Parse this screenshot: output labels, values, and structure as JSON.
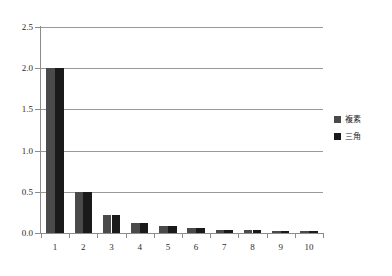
{
  "chart_data": {
    "type": "bar",
    "title": "",
    "xlabel": "",
    "ylabel": "",
    "categories": [
      "1",
      "2",
      "3",
      "4",
      "5",
      "6",
      "7",
      "8",
      "9",
      "10"
    ],
    "series": [
      {
        "name": "複素",
        "color": "#4a4a4a",
        "values": [
          2.0,
          0.5,
          0.222,
          0.125,
          0.08,
          0.056,
          0.041,
          0.031,
          0.025,
          0.02
        ]
      },
      {
        "name": "三角",
        "color": "#1a1a1a",
        "values": [
          2.0,
          0.5,
          0.222,
          0.125,
          0.08,
          0.056,
          0.041,
          0.031,
          0.025,
          0.02
        ]
      }
    ],
    "ylim": [
      0.0,
      2.5
    ],
    "yticks": [
      "0.0",
      "0.5",
      "1.0",
      "1.5",
      "2.0",
      "2.5"
    ],
    "ytick_values": [
      0.0,
      0.5,
      1.0,
      1.5,
      2.0,
      2.5
    ],
    "grid": true,
    "grid_axis": "y",
    "legend_position": "right",
    "legend": [
      "複素",
      "三角"
    ],
    "axis_color": "#8c8c8c",
    "grid_color": "#999999",
    "background": "#ffffff"
  }
}
